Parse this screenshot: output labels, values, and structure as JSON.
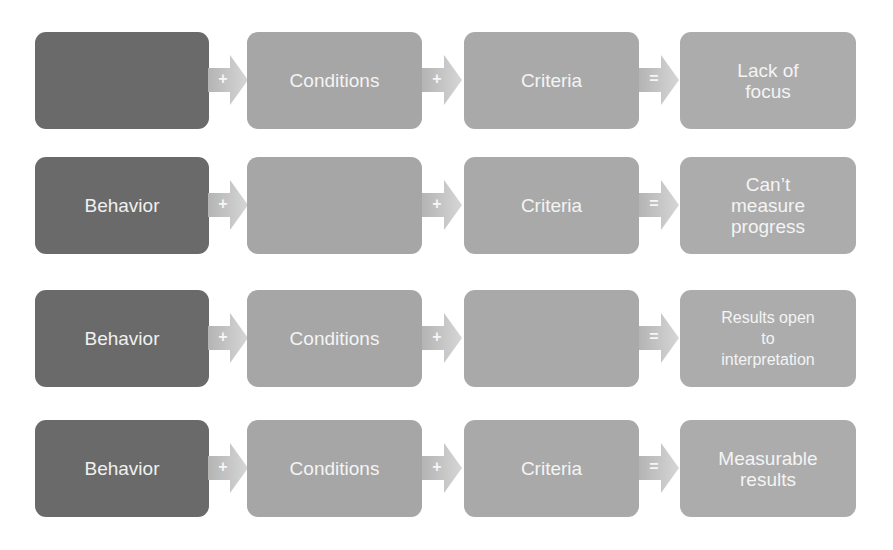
{
  "colors": {
    "behavior_box": "#6a6a6a",
    "conditions_box": "#a6a6a6",
    "criteria_box": "#a9a9a9",
    "result_box": "#acacac",
    "arrow_fill": "#c8c8c8",
    "text": "#ffffff"
  },
  "rows": [
    {
      "behavior": "",
      "op1": "+",
      "conditions": "Conditions",
      "op2": "+",
      "criteria": "Criteria",
      "op3": "=",
      "result": "Lack of\nfocus"
    },
    {
      "behavior": "Behavior",
      "op1": "+",
      "conditions": "",
      "op2": "+",
      "criteria": "Criteria",
      "op3": "=",
      "result": "Can’t\nmeasure\nprogress"
    },
    {
      "behavior": "Behavior",
      "op1": "+",
      "conditions": "Conditions",
      "op2": "+",
      "criteria": "",
      "op3": "=",
      "result": "Results open\nto\ninterpretation"
    },
    {
      "behavior": "Behavior",
      "op1": "+",
      "conditions": "Conditions",
      "op2": "+",
      "criteria": "Criteria",
      "op3": "=",
      "result": "Measurable\nresults"
    }
  ]
}
